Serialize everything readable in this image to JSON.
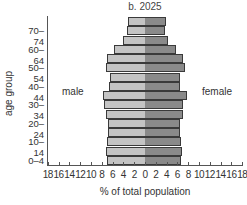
{
  "chart_data": {
    "type": "bar",
    "orientation": "horizontal-population-pyramid",
    "title": "b. 2025",
    "xlabel": "% of total population",
    "ylabel": "age group",
    "categories": [
      "0–4",
      "5–9",
      "10–14",
      "15–19",
      "20–24",
      "25–29",
      "30–34",
      "35–39",
      "40–44",
      "45–49",
      "50–54",
      "55–59",
      "60–64",
      "65–69",
      "70–74",
      "75+"
    ],
    "ytick_labels": [
      "0–4",
      "10–14",
      "20–24",
      "30–34",
      "40–44",
      "50–54",
      "60–64",
      "70–74"
    ],
    "xtick_labels": [
      "18",
      "16",
      "14",
      "12",
      "10",
      "8",
      "6",
      "4",
      "2",
      "0",
      "2",
      "4",
      "6",
      "8",
      "10",
      "12",
      "14",
      "16",
      "18"
    ],
    "xlim": [
      -18,
      18
    ],
    "series": [
      {
        "name": "male",
        "color": "#c4c4c4",
        "values": [
          7.0,
          7.2,
          7.0,
          6.9,
          6.9,
          7.2,
          7.6,
          7.8,
          6.7,
          6.5,
          7.2,
          7.0,
          5.7,
          4.1,
          3.3,
          3.1
        ]
      },
      {
        "name": "female",
        "color": "#8a8a8a",
        "values": [
          6.7,
          6.9,
          6.7,
          6.5,
          6.5,
          7.0,
          7.0,
          7.8,
          6.5,
          6.5,
          7.4,
          7.0,
          5.7,
          4.3,
          3.7,
          3.9
        ]
      }
    ],
    "annotations": [
      "male",
      "female"
    ],
    "grid": false
  }
}
